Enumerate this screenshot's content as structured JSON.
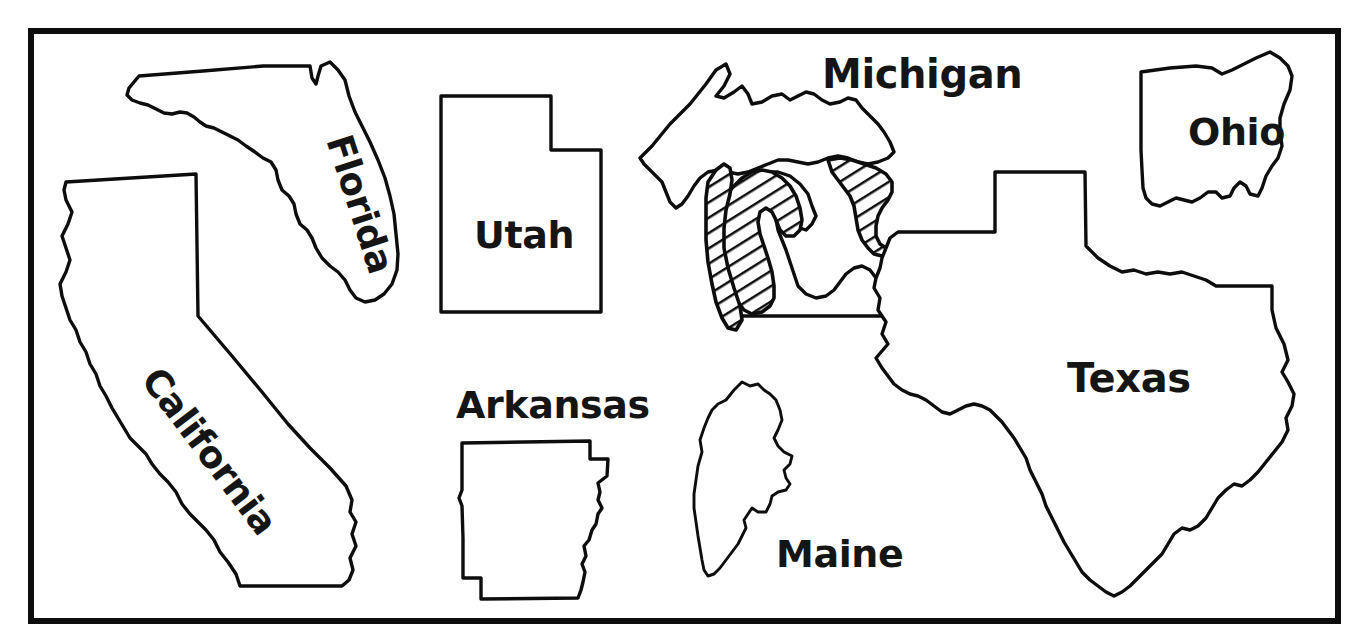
{
  "figure": {
    "kind": "map-worksheet",
    "background_color": "#ffffff",
    "ink_color": "#0d0d0d",
    "frame": {
      "x": 30,
      "y": 30,
      "width": 1309,
      "height": 592,
      "stroke_width": 6
    }
  },
  "states": [
    {
      "id": "florida",
      "label": "Florida",
      "label_rotation_deg": 72,
      "label_x": 326,
      "label_y": 140,
      "label_size": 37,
      "hatched": false
    },
    {
      "id": "california",
      "label": "California",
      "label_rotation_deg": 53,
      "label_x": 140,
      "label_y": 380,
      "label_size": 37,
      "hatched": false
    },
    {
      "id": "utah",
      "label": "Utah",
      "label_rotation_deg": 0,
      "label_x": 474,
      "label_y": 248,
      "label_size": 38,
      "hatched": false
    },
    {
      "id": "michigan",
      "label": "Michigan",
      "label_rotation_deg": 0,
      "label_x": 822,
      "label_y": 88,
      "label_size": 40,
      "hatched": true
    },
    {
      "id": "ohio",
      "label": "Ohio",
      "label_rotation_deg": 0,
      "label_x": 1188,
      "label_y": 145,
      "label_size": 38,
      "hatched": false
    },
    {
      "id": "arkansas",
      "label": "Arkansas",
      "label_rotation_deg": 0,
      "label_x": 456,
      "label_y": 418,
      "label_size": 38,
      "hatched": false
    },
    {
      "id": "maine",
      "label": "Maine",
      "label_rotation_deg": 0,
      "label_x": 776,
      "label_y": 567,
      "label_size": 38,
      "hatched": false
    },
    {
      "id": "texas",
      "label": "Texas",
      "label_rotation_deg": 0,
      "label_x": 1067,
      "label_y": 392,
      "label_size": 40,
      "hatched": false
    }
  ]
}
